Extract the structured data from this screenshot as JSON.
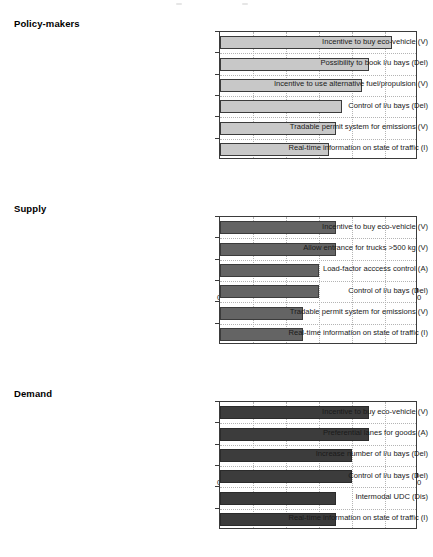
{
  "chart_data": [
    {
      "type": "bar",
      "title": "Policy-makers",
      "orientation": "horizontal",
      "xlabel": "",
      "ylabel": "",
      "xlim": [
        0,
        60
      ],
      "xticks": [
        0,
        10,
        20,
        30,
        40,
        50,
        60
      ],
      "xticklabels": [
        "0",
        "10",
        "20",
        "30",
        "40",
        "50",
        "60"
      ],
      "grid": true,
      "legend": "none",
      "bar_color": "#c8c8c8",
      "bar_edge_color": "#3b3b3b",
      "categories": [
        "Incentive to buy eco-vehicle (V)",
        "Possibility to book l/u bays (Del)",
        "Incentive to use alternative fuel/propulsion (V)",
        "Control of l/u bays (Del)",
        "Tradable permit system for emissions (V)",
        "Real-time information on state of traffic (I)"
      ],
      "values": [
        52,
        45,
        43,
        37,
        35,
        33
      ]
    },
    {
      "type": "bar",
      "title": "Supply",
      "orientation": "horizontal",
      "xlabel": "",
      "ylabel": "",
      "xlim": [
        0,
        60
      ],
      "xticks": [
        0,
        10,
        20,
        30,
        40,
        50,
        60
      ],
      "xticklabels": [
        "0",
        "10",
        "20",
        "30",
        "40",
        "50",
        "60"
      ],
      "grid": true,
      "legend": "none",
      "bar_color": "#646464",
      "bar_edge_color": "#3b3b3b",
      "categories": [
        "Incentive to buy eco-vehicle (V)",
        "Allow entrance for trucks >500 kg (V)",
        "Load-factor acccess control (A)",
        "Control of l/u bays (Del)",
        "Tradable permit system for emissions (V)",
        "Real-time information on state of traffic (I)"
      ],
      "values": [
        35,
        35,
        30,
        30,
        25,
        25
      ]
    },
    {
      "type": "bar",
      "title": "Demand",
      "orientation": "horizontal",
      "xlabel": "",
      "ylabel": "",
      "xlim": [
        0,
        60
      ],
      "xticks": [
        0,
        10,
        20,
        30,
        40,
        50,
        60
      ],
      "xticklabels": [
        "0",
        "10",
        "20",
        "30",
        "40",
        "50",
        "60"
      ],
      "grid": true,
      "legend": "none",
      "bar_color": "#3c3c3c",
      "bar_edge_color": "#2b2b2b",
      "categories": [
        "Incentive to buy eco-vehicle (V)",
        "Preferential lanes for goods (A)",
        "Increase number of l/u bays (Del)",
        "Control of l/u bays (Del)",
        "Intermodal UDC (Dis)",
        "Real-time information on state of traffic (I)"
      ],
      "values": [
        45,
        45,
        40,
        40,
        35,
        35
      ]
    }
  ]
}
